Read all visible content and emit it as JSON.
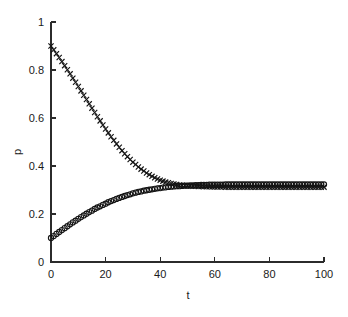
{
  "figure": {
    "background_color": "#ffffff",
    "foreground_color": "#1a1a1a",
    "title": "",
    "width": 348,
    "height": 317
  },
  "axes": {
    "x_title": "t",
    "y_title": "p",
    "x_ticks": [
      "0",
      "20",
      "40",
      "60",
      "80",
      "100"
    ],
    "y_ticks": [
      "0",
      "0.2",
      "0.4",
      "0.6",
      "0.8",
      "1"
    ],
    "top_spine": false,
    "right_spine": false,
    "grid": false
  },
  "chart_data": {
    "type": "scatter",
    "title": "",
    "xlabel": "t",
    "ylabel": "p",
    "xlim": [
      0,
      100
    ],
    "ylim": [
      0,
      1
    ],
    "xticks": [
      0,
      20,
      40,
      60,
      80,
      100
    ],
    "yticks": [
      0,
      0.2,
      0.4,
      0.6,
      0.8,
      1
    ],
    "grid": false,
    "legend": "none",
    "annotations": [],
    "x": [
      0,
      1,
      2,
      3,
      4,
      5,
      6,
      7,
      8,
      9,
      10,
      11,
      12,
      13,
      14,
      15,
      16,
      17,
      18,
      19,
      20,
      21,
      22,
      23,
      24,
      25,
      26,
      27,
      28,
      29,
      30,
      31,
      32,
      33,
      34,
      35,
      36,
      37,
      38,
      39,
      40,
      41,
      42,
      43,
      44,
      45,
      46,
      47,
      48,
      49,
      50,
      51,
      52,
      53,
      54,
      55,
      56,
      57,
      58,
      59,
      60,
      61,
      62,
      63,
      64,
      65,
      66,
      67,
      68,
      69,
      70,
      71,
      72,
      73,
      74,
      75,
      76,
      77,
      78,
      79,
      80,
      81,
      82,
      83,
      84,
      85,
      86,
      87,
      88,
      89,
      90,
      91,
      92,
      93,
      94,
      95,
      96,
      97,
      98,
      99,
      100
    ],
    "series": [
      {
        "name": "decaying",
        "marker": "x",
        "color": "#141414",
        "values": [
          0.9,
          0.884,
          0.868,
          0.852,
          0.835,
          0.818,
          0.801,
          0.784,
          0.766,
          0.749,
          0.731,
          0.713,
          0.695,
          0.677,
          0.659,
          0.641,
          0.623,
          0.605,
          0.588,
          0.571,
          0.554,
          0.538,
          0.522,
          0.507,
          0.492,
          0.478,
          0.464,
          0.451,
          0.439,
          0.427,
          0.416,
          0.406,
          0.396,
          0.387,
          0.379,
          0.371,
          0.364,
          0.357,
          0.351,
          0.346,
          0.341,
          0.337,
          0.333,
          0.33,
          0.327,
          0.325,
          0.323,
          0.321,
          0.32,
          0.319,
          0.318,
          0.317,
          0.316,
          0.316,
          0.315,
          0.315,
          0.314,
          0.314,
          0.314,
          0.313,
          0.313,
          0.313,
          0.313,
          0.313,
          0.312,
          0.312,
          0.312,
          0.312,
          0.312,
          0.312,
          0.312,
          0.312,
          0.312,
          0.312,
          0.312,
          0.312,
          0.312,
          0.312,
          0.312,
          0.312,
          0.312,
          0.312,
          0.312,
          0.312,
          0.312,
          0.312,
          0.312,
          0.312,
          0.312,
          0.312,
          0.312,
          0.312,
          0.312,
          0.312,
          0.312,
          0.312,
          0.312,
          0.312,
          0.312,
          0.312,
          0.312
        ]
      },
      {
        "name": "rising",
        "marker": "o",
        "color": "#141414",
        "values": [
          0.1,
          0.108,
          0.117,
          0.125,
          0.133,
          0.141,
          0.149,
          0.157,
          0.165,
          0.172,
          0.18,
          0.187,
          0.194,
          0.201,
          0.208,
          0.214,
          0.221,
          0.227,
          0.232,
          0.238,
          0.243,
          0.249,
          0.254,
          0.258,
          0.263,
          0.267,
          0.271,
          0.275,
          0.279,
          0.282,
          0.286,
          0.289,
          0.292,
          0.294,
          0.297,
          0.299,
          0.301,
          0.303,
          0.305,
          0.307,
          0.308,
          0.31,
          0.311,
          0.313,
          0.314,
          0.315,
          0.316,
          0.316,
          0.317,
          0.318,
          0.318,
          0.319,
          0.319,
          0.32,
          0.32,
          0.321,
          0.321,
          0.321,
          0.322,
          0.322,
          0.322,
          0.322,
          0.322,
          0.322,
          0.323,
          0.323,
          0.323,
          0.323,
          0.323,
          0.323,
          0.323,
          0.323,
          0.323,
          0.323,
          0.323,
          0.323,
          0.323,
          0.323,
          0.323,
          0.323,
          0.323,
          0.323,
          0.323,
          0.323,
          0.323,
          0.323,
          0.323,
          0.323,
          0.323,
          0.323,
          0.323,
          0.323,
          0.323,
          0.323,
          0.323,
          0.323,
          0.323,
          0.323,
          0.323,
          0.323,
          0.323
        ]
      }
    ]
  }
}
